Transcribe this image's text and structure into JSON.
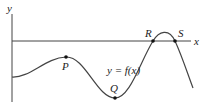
{
  "diagram": {
    "type": "function-graph",
    "axes": {
      "x_label": "x",
      "y_label": "y"
    },
    "curve_label": "y = f(x)",
    "points": [
      {
        "name": "P",
        "label": "P",
        "kind": "local maximum",
        "x": 66,
        "y": 57
      },
      {
        "name": "Q",
        "label": "Q",
        "kind": "local minimum",
        "x": 115,
        "y": 98
      },
      {
        "name": "R",
        "label": "R",
        "kind": "x-intercept",
        "x": 153,
        "y": 41
      },
      {
        "name": "S",
        "label": "S",
        "kind": "x-intercept",
        "x": 175,
        "y": 41
      }
    ],
    "colors": {
      "line": "#444444",
      "point": "#111111",
      "background": "#ffffff"
    }
  }
}
